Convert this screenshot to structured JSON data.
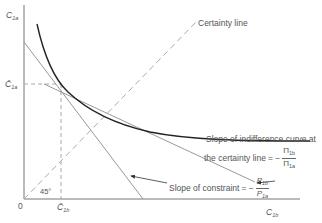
{
  "diagram": {
    "axes": {
      "y_label_main": "C",
      "y_label_sub": "1a",
      "x_label_main": "C",
      "x_label_sub": "1b",
      "origin_label": "0"
    },
    "certainty_line": {
      "label": "Certainty line",
      "angle_label": "45°"
    },
    "bar_points": {
      "y_label_main": "C̄",
      "y_label_sub": "1a",
      "x_label_main": "C̄",
      "x_label_sub": "1b"
    },
    "annotations": {
      "indifference_slope_line1": "Slope of indifference curve at",
      "indifference_slope_line2": "the certainty line",
      "indifference_slope_eq": "= −",
      "indifference_num": "Π",
      "indifference_num_sub": "1b",
      "indifference_den": "Π",
      "indifference_den_sub": "1a",
      "constraint_slope": "Slope of constraint",
      "constraint_eq": "= −",
      "constraint_num": "P",
      "constraint_num_sub": "1b",
      "constraint_den": "P",
      "constraint_den_sub": "1a"
    },
    "colors": {
      "axis": "#777777",
      "curve": "#222222",
      "lines": "#999999",
      "dashed": "#aaaaaa"
    }
  }
}
